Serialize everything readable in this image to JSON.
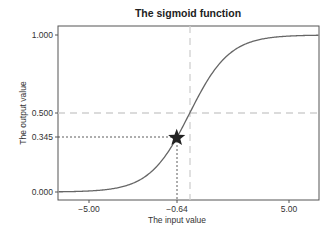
{
  "chart_data": {
    "type": "line",
    "title": "The sigmoid function",
    "xlabel": "The input value",
    "ylabel": "The output value",
    "xlim": [
      -6.6,
      6.5
    ],
    "ylim": [
      -0.05,
      1.05
    ],
    "grid": false,
    "function": "1 / (1 + exp(-x))",
    "xticks": [
      -5.0,
      -0.64,
      5.0
    ],
    "xtick_labels": [
      "−5.00",
      "−0.64",
      "5.00"
    ],
    "yticks": [
      0.0,
      0.345,
      0.5,
      1.0
    ],
    "ytick_labels": [
      "0.000",
      "0.345",
      "0.500",
      "1.000"
    ],
    "series": [
      {
        "name": "sigmoid",
        "color": "#666666",
        "x": [
          -6.5,
          -5,
          -4,
          -3,
          -2,
          -1,
          -0.64,
          0,
          1,
          2,
          3,
          4,
          5,
          6.5
        ],
        "y": [
          0.0015,
          0.0067,
          0.018,
          0.047,
          0.119,
          0.269,
          0.345,
          0.5,
          0.731,
          0.881,
          0.953,
          0.982,
          0.993,
          0.9985
        ]
      }
    ],
    "annotations": [
      {
        "type": "marker",
        "shape": "star",
        "x": -0.64,
        "y": 0.345,
        "color": "#222222"
      },
      {
        "type": "hline",
        "y": 0.5,
        "style": "dashed",
        "color": "#cccccc"
      },
      {
        "type": "vline",
        "x": 0,
        "style": "dashed",
        "color": "#cccccc"
      },
      {
        "type": "guide",
        "from": [
          -6.6,
          0.345
        ],
        "to": [
          -0.64,
          0.345
        ],
        "style": "dotted",
        "color": "#333333"
      },
      {
        "type": "guide",
        "from": [
          -0.64,
          0.345
        ],
        "to": [
          -0.64,
          -0.05
        ],
        "style": "dotted",
        "color": "#333333"
      }
    ]
  }
}
